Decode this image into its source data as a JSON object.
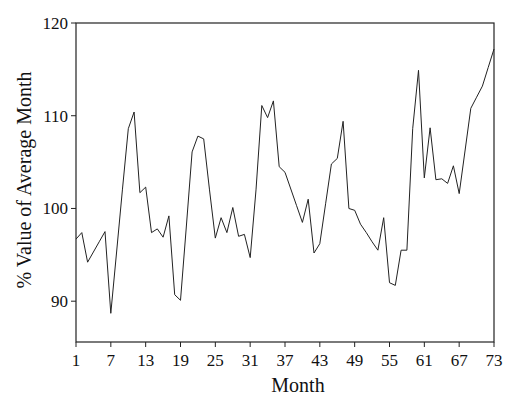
{
  "chart_data": {
    "type": "line",
    "title": "",
    "xlabel": "Month",
    "ylabel": "% Value of Average Month",
    "xlim": [
      1,
      73
    ],
    "ylim": [
      85.6,
      120
    ],
    "grid": false,
    "legend": null,
    "x_ticks": [
      1,
      7,
      13,
      19,
      25,
      31,
      37,
      43,
      49,
      55,
      61,
      67,
      73
    ],
    "y_ticks": [
      90,
      100,
      110,
      120
    ],
    "series": [
      {
        "name": "% Value of Average Month",
        "color": "#222222",
        "x": [
          1,
          2,
          3,
          4,
          5,
          6,
          7,
          8,
          9,
          10,
          11,
          12,
          13,
          14,
          15,
          16,
          17,
          18,
          19,
          20,
          21,
          22,
          23,
          24,
          25,
          26,
          27,
          28,
          29,
          30,
          31,
          32,
          33,
          34,
          35,
          36,
          37,
          38,
          39,
          40,
          41,
          42,
          43,
          44,
          45,
          46,
          47,
          48,
          49,
          50,
          51,
          52,
          53,
          54,
          55,
          56,
          57,
          58,
          59,
          60,
          61,
          62,
          63,
          64,
          65,
          66,
          67,
          68,
          69,
          70,
          71,
          72,
          73
        ],
        "values": [
          96.7,
          97.4,
          94.2,
          95.3,
          96.4,
          97.5,
          88.7,
          95.3,
          102.0,
          108.6,
          110.4,
          101.7,
          102.3,
          97.4,
          97.8,
          96.9,
          99.2,
          90.7,
          90.1,
          98.0,
          106.1,
          107.8,
          107.5,
          102.0,
          96.8,
          99.0,
          97.4,
          100.1,
          97.0,
          97.2,
          94.7,
          102.0,
          111.1,
          109.8,
          111.6,
          104.5,
          103.9,
          102.1,
          100.3,
          98.5,
          101.0,
          95.2,
          96.2,
          100.5,
          104.8,
          105.4,
          109.4,
          100.0,
          99.8,
          98.3,
          97.4,
          96.4,
          95.5,
          99.0,
          92.0,
          91.7,
          95.5,
          95.5,
          108.6,
          114.9,
          103.3,
          108.7,
          103.1,
          103.2,
          102.7,
          104.6,
          101.6,
          106.2,
          110.8,
          112.0,
          113.2,
          115.2,
          117.2
        ]
      }
    ]
  }
}
